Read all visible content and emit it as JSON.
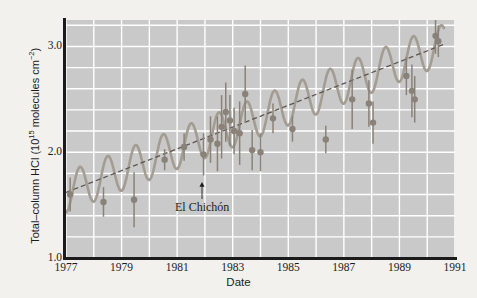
{
  "chart_data": {
    "type": "scatter",
    "title": "",
    "xlabel": "Date",
    "ylabel": "Total-column HCl (10^15 molecules cm^-2)",
    "ylabel_parts": {
      "main": "Total–column HCl (10",
      "exp1": "15",
      "mid": " molecules cm",
      "exp2": "−2",
      "tail": ")"
    },
    "xlim": [
      1977,
      1991
    ],
    "ylim": [
      1.0,
      3.25
    ],
    "grid": true,
    "grid_color": "#ffffff",
    "plot_bg": "#c9c9c9",
    "marker_color": "#8a8279",
    "errorbar_color": "#8a8279",
    "fit_color": "#a39c92",
    "trend_color": "#5d564e",
    "legend": [],
    "xticks": [
      1977,
      1979,
      1981,
      1983,
      1985,
      1987,
      1989,
      1991
    ],
    "xtick_labels": [
      "1977",
      "1979",
      "1981",
      "1983",
      "1985",
      "1987",
      "1989",
      "1991"
    ],
    "x_minor_tick_step": 1,
    "yticks": [
      1.0,
      2.0,
      3.0
    ],
    "ytick_labels": [
      "1.0",
      "2.0",
      "3.0"
    ],
    "y_minor_tick_step": 0.2,
    "annotations": [
      {
        "text": "El Chichón",
        "x": 1981.9,
        "y": 1.48,
        "arrow_to_y": 1.72,
        "name": "el-chichon-eruption-marker"
      }
    ],
    "trend_line": {
      "style": "dashed",
      "x_start": 1977.0,
      "y_start": 1.62,
      "x_end": 1990.6,
      "y_end": 3.02
    },
    "seasonal_fit": {
      "style": "solid",
      "description": "annual sinusoidal oscillation superimposed on linear trend",
      "period_years": 1.0,
      "amplitude": 0.19
    },
    "points": [
      {
        "x": 1977.15,
        "y": 1.6,
        "yerr": 0.16
      },
      {
        "x": 1978.35,
        "y": 1.53,
        "yerr": 0.14
      },
      {
        "x": 1979.45,
        "y": 1.55,
        "yerr": 0.26
      },
      {
        "x": 1980.55,
        "y": 1.93,
        "yerr": 0.1
      },
      {
        "x": 1981.25,
        "y": 2.05,
        "yerr": 0.13
      },
      {
        "x": 1981.95,
        "y": 1.98,
        "yerr": 0.2
      },
      {
        "x": 1982.2,
        "y": 2.12,
        "yerr": 0.22
      },
      {
        "x": 1982.45,
        "y": 2.08,
        "yerr": 0.26
      },
      {
        "x": 1982.6,
        "y": 2.24,
        "yerr": 0.3
      },
      {
        "x": 1982.75,
        "y": 2.38,
        "yerr": 0.28
      },
      {
        "x": 1982.9,
        "y": 2.3,
        "yerr": 0.24
      },
      {
        "x": 1983.05,
        "y": 2.2,
        "yerr": 0.22
      },
      {
        "x": 1983.25,
        "y": 2.18,
        "yerr": 0.3
      },
      {
        "x": 1983.45,
        "y": 2.55,
        "yerr": 0.27
      },
      {
        "x": 1983.7,
        "y": 2.02,
        "yerr": 0.19
      },
      {
        "x": 1984.0,
        "y": 2.0,
        "yerr": 0.18
      },
      {
        "x": 1984.45,
        "y": 2.32,
        "yerr": 0.14
      },
      {
        "x": 1985.15,
        "y": 2.22,
        "yerr": 0.12
      },
      {
        "x": 1986.35,
        "y": 2.12,
        "yerr": 0.13
      },
      {
        "x": 1987.3,
        "y": 2.5,
        "yerr": 0.28
      },
      {
        "x": 1987.9,
        "y": 2.46,
        "yerr": 0.22
      },
      {
        "x": 1988.05,
        "y": 2.28,
        "yerr": 0.2
      },
      {
        "x": 1989.25,
        "y": 2.72,
        "yerr": 0.18
      },
      {
        "x": 1989.45,
        "y": 2.58,
        "yerr": 0.25
      },
      {
        "x": 1989.55,
        "y": 2.5,
        "yerr": 0.22
      },
      {
        "x": 1990.3,
        "y": 3.1,
        "yerr": 0.17
      },
      {
        "x": 1990.4,
        "y": 3.05,
        "yerr": 0.15
      }
    ]
  }
}
